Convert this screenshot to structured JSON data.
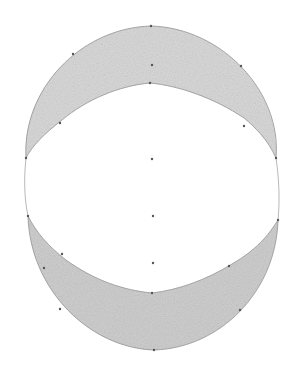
{
  "figure": {
    "width": 302,
    "height": 376,
    "background": "#ffffff",
    "shade_color": "#d9d9d9",
    "shade_color_dark": "#cfcfcf",
    "stroke_color": "#9a9a9a",
    "point_color": "#555555",
    "upper_crescent": {
      "outer_path": "M 26 158 C 22 90, 80 28, 151 26 C 222 28, 282 92, 276 158",
      "inner_path": "M 276 158 C 268 140, 256 128, 244 118 C 214 98, 180 86, 150 83 C 118 86, 86 100, 62 120 C 44 134, 32 146, 26 158 Z"
    },
    "lower_crescent": {
      "outer_path": "M 28 216 C 30 290, 90 348, 154 350 C 220 348, 276 292, 278 220",
      "inner_path": "M 278 220 C 268 236, 256 250, 232 264 C 206 280, 178 290, 152 293 C 122 290, 94 280, 66 260 C 48 246, 36 232, 28 216 Z"
    },
    "side_lines": {
      "left": "M 26 158 C 24 176, 24 198, 28 216",
      "right": "M 276 158 C 279 178, 280 200, 278 220"
    },
    "points": [
      {
        "x": 151,
        "y": 26
      },
      {
        "x": 73,
        "y": 54
      },
      {
        "x": 241,
        "y": 66
      },
      {
        "x": 152,
        "y": 65
      },
      {
        "x": 150,
        "y": 83
      },
      {
        "x": 60,
        "y": 123
      },
      {
        "x": 244,
        "y": 126
      },
      {
        "x": 26,
        "y": 158
      },
      {
        "x": 276,
        "y": 158
      },
      {
        "x": 152,
        "y": 159
      },
      {
        "x": 153,
        "y": 216
      },
      {
        "x": 28,
        "y": 216
      },
      {
        "x": 278,
        "y": 220
      },
      {
        "x": 62,
        "y": 254
      },
      {
        "x": 229,
        "y": 266
      },
      {
        "x": 44,
        "y": 268
      },
      {
        "x": 153,
        "y": 263
      },
      {
        "x": 152,
        "y": 293
      },
      {
        "x": 60,
        "y": 309
      },
      {
        "x": 240,
        "y": 310
      },
      {
        "x": 154,
        "y": 350
      }
    ]
  }
}
